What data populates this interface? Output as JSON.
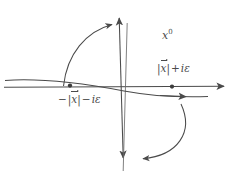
{
  "figure": {
    "background_color": "#ffffff",
    "ink_color": "#4a4a4a",
    "width": 238,
    "height": 176
  },
  "labels": {
    "axis_vertical": {
      "text_base": "x",
      "text_sup": "0",
      "full": "x^0",
      "x": 162,
      "y": 30
    },
    "pole_right": {
      "prefix": "",
      "modulus_open": "|",
      "variable": "x",
      "modulus_close": "|",
      "operator": "+",
      "imaginary": "iε",
      "full": "|x⃗| + iε",
      "x": 157,
      "y": 63
    },
    "pole_left": {
      "prefix": "−",
      "modulus_open": "|",
      "variable": "x",
      "modulus_close": "|",
      "operator": "−",
      "imaginary": "iε",
      "full": "−|x⃗| − iε",
      "x": 57,
      "y": 94
    }
  },
  "markers": {
    "pole_right_dot": {
      "cx": 172,
      "cy": 86.5,
      "r": 2.1
    },
    "pole_left_dot": {
      "cx": 70,
      "cy": 85.5,
      "r": 2.1
    }
  },
  "axes": {
    "real_axis": {
      "name": "real-axis",
      "x1": 4,
      "y1": 87,
      "x2": 228,
      "y2": 86,
      "arrow": "right"
    },
    "imaginary_axis": {
      "name": "imaginary-axis",
      "x1": 119.5,
      "y1": 14,
      "x2": 123.5,
      "y2": 162,
      "arrow": "both"
    },
    "imaginary_axis_parallel": {
      "name": "imaginary-axis-parallel-line",
      "x1": 127,
      "y1": 22,
      "x2": 123,
      "y2": 170
    }
  },
  "contour": {
    "name": "integration-contour",
    "path": "M 6,80 C 60,77 95,86 124,91 C 152,96 176,98 206,97",
    "arrow_at": {
      "x": 186,
      "y": 96.5,
      "angle": 4
    }
  },
  "rotation_arrows": [
    {
      "name": "wick-rotation-arrow-upper",
      "path": "M 64,85 C 68,52 88,30 114,24",
      "tip": {
        "x": 118,
        "y": 23,
        "angle": -17
      }
    },
    {
      "name": "wick-rotation-arrow-lower",
      "path": "M 181,105 C 193,133 178,155 141,159",
      "tip": {
        "x": 136,
        "y": 159,
        "angle": 186
      }
    }
  ]
}
